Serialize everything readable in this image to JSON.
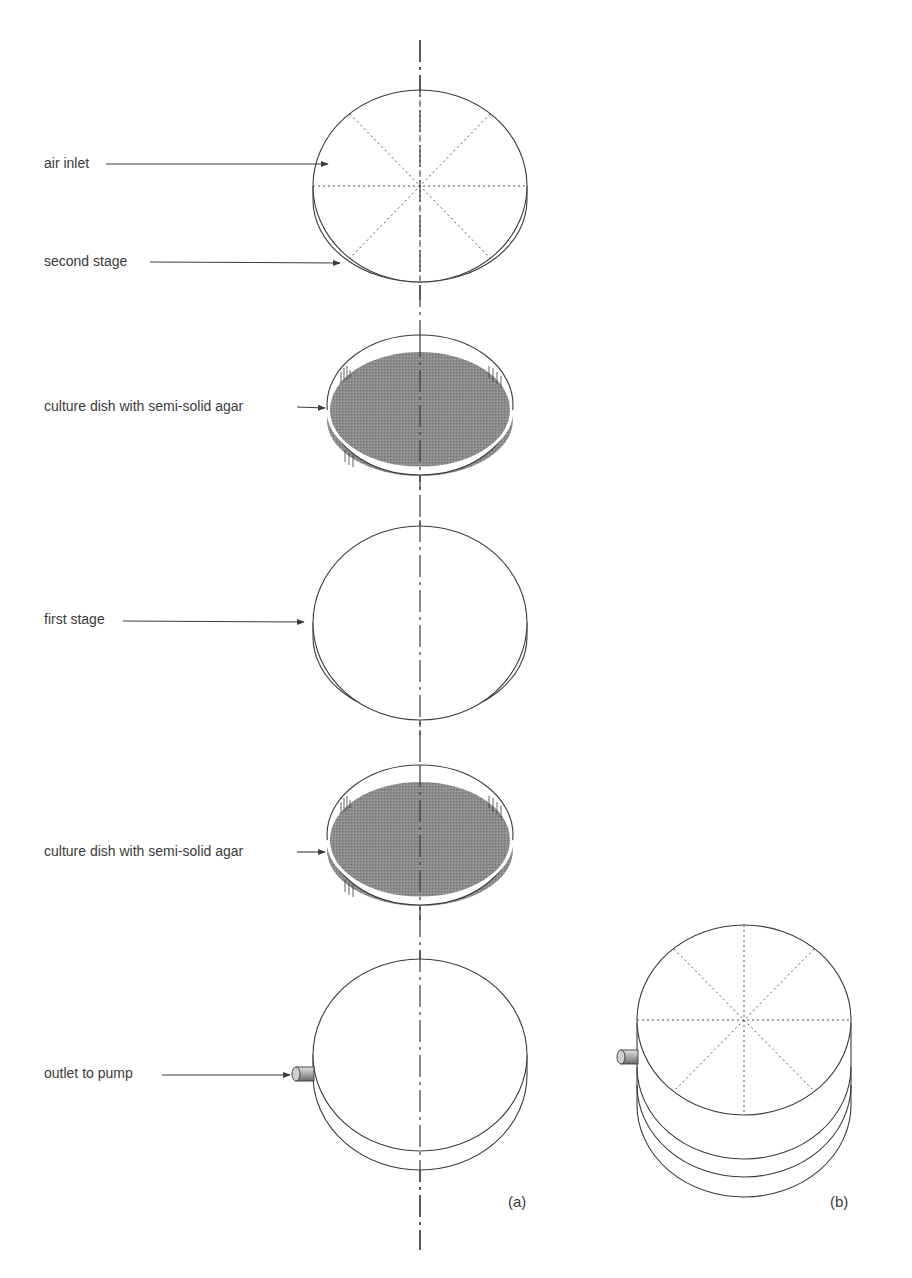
{
  "figure": {
    "panels": [
      {
        "id": "a",
        "label": "(a)"
      },
      {
        "id": "b",
        "label": "(b)"
      }
    ],
    "labels": {
      "air_inlet": "air inlet",
      "second_stage": "second stage",
      "culture_dish_1": "culture dish with semi-solid agar",
      "first_stage": "first stage",
      "culture_dish_2": "culture dish with semi-solid agar",
      "outlet_to_pump": "outlet to pump"
    },
    "colors": {
      "line": "#3a3a3a",
      "agar": "#8a8a8a",
      "agar_dark": "#7a7a7a",
      "dotted": "#555555"
    }
  }
}
